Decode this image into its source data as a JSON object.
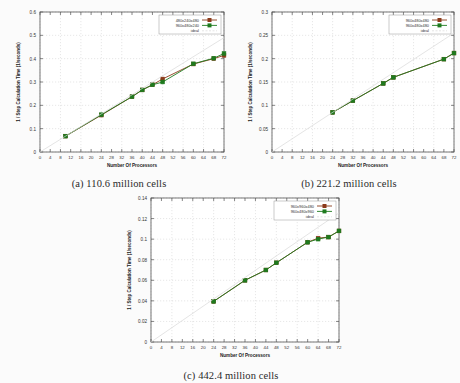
{
  "figure": {
    "background_color": "#fbfbfb",
    "panels": [
      {
        "key": "a",
        "caption": "(a) 110.6 million cells",
        "chart_data": {
          "type": "line",
          "title": "",
          "xlabel": "Number Of Processors",
          "ylabel": "1 / Step Calculation Time (1/seconds)",
          "xlim": [
            0,
            72
          ],
          "ylim": [
            0,
            0.6
          ],
          "xticks": [
            0,
            4,
            8,
            12,
            16,
            20,
            24,
            28,
            32,
            36,
            40,
            44,
            48,
            52,
            56,
            60,
            64,
            68,
            72
          ],
          "yticks": [
            0,
            0.1,
            0.2,
            0.3,
            0.4,
            0.5,
            0.6
          ],
          "xtick_labels": [
            "0",
            "4",
            "8",
            "12",
            "16",
            "20",
            "24",
            "28",
            "32",
            "36",
            "40",
            "44",
            "48",
            "52",
            "56",
            "60",
            "64",
            "68",
            "72"
          ],
          "ytick_labels": [
            "0",
            "0.1",
            "0.2",
            "0.3",
            "0.4",
            "0.5",
            "0.6"
          ],
          "grid": true,
          "legend_position": "top-right",
          "series": [
            {
              "name": "480x240x480",
              "color": "#8B3A1A",
              "marker": "square",
              "x": [
                10,
                24,
                36,
                40,
                44,
                48,
                60,
                68,
                72
              ],
              "y": [
                0.068,
                0.158,
                0.237,
                0.266,
                0.288,
                0.313,
                0.377,
                0.4,
                0.414
              ]
            },
            {
              "name": "960x480x240",
              "color": "#1E7A1E",
              "marker": "square",
              "x": [
                10,
                24,
                36,
                40,
                44,
                48,
                60,
                68,
                72
              ],
              "y": [
                0.068,
                0.16,
                0.237,
                0.266,
                0.288,
                0.3,
                0.378,
                0.402,
                0.422
              ]
            },
            {
              "name": "ideal",
              "color": "#d8d8d8",
              "marker": "none",
              "x": [
                0,
                72
              ],
              "y": [
                0,
                0.49
              ]
            }
          ]
        }
      },
      {
        "key": "b",
        "caption": "(b) 221.2 million cells",
        "chart_data": {
          "type": "line",
          "title": "",
          "xlabel": "Number Of Processors",
          "ylabel": "1 / Step Calculation Time (1/seconds)",
          "xlim": [
            0,
            72
          ],
          "ylim": [
            0,
            0.3
          ],
          "xticks": [
            0,
            4,
            8,
            12,
            16,
            20,
            24,
            28,
            32,
            36,
            40,
            44,
            48,
            52,
            56,
            60,
            64,
            68,
            72
          ],
          "yticks": [
            0,
            0.05,
            0.1,
            0.15,
            0.2,
            0.25,
            0.3
          ],
          "xtick_labels": [
            "0",
            "4",
            "8",
            "12",
            "16",
            "20",
            "24",
            "28",
            "32",
            "36",
            "40",
            "44",
            "48",
            "52",
            "56",
            "60",
            "64",
            "68",
            "72"
          ],
          "ytick_labels": [
            "0",
            "0.05",
            "0.1",
            "0.15",
            "0.2",
            "0.25",
            "0.3"
          ],
          "grid": true,
          "legend_position": "top-right",
          "series": [
            {
              "name": "960x480x480",
              "color": "#8B3A1A",
              "marker": "square",
              "x": [
                24,
                32,
                44,
                48,
                68,
                72
              ],
              "y": [
                0.085,
                0.11,
                0.147,
                0.16,
                0.199,
                0.212
              ]
            },
            {
              "name": "960x480x480",
              "color": "#1E7A1E",
              "marker": "square",
              "x": [
                24,
                32,
                44,
                48,
                68,
                72
              ],
              "y": [
                0.085,
                0.11,
                0.147,
                0.16,
                0.199,
                0.212
              ]
            },
            {
              "name": "ideal",
              "color": "#d8d8d8",
              "marker": "none",
              "x": [
                0,
                72
              ],
              "y": [
                0,
                0.255
              ]
            }
          ]
        }
      },
      {
        "key": "c",
        "caption": "(c) 442.4 million cells",
        "chart_data": {
          "type": "line",
          "title": "",
          "xlabel": "Number Of Processors",
          "ylabel": "1 / Step Calculation Time (1/seconds)",
          "xlim": [
            0,
            72
          ],
          "ylim": [
            0,
            0.14
          ],
          "xticks": [
            0,
            4,
            8,
            12,
            16,
            20,
            24,
            28,
            32,
            36,
            40,
            44,
            48,
            52,
            56,
            60,
            64,
            68,
            72
          ],
          "yticks": [
            0,
            0.02,
            0.04,
            0.06,
            0.08,
            0.1,
            0.12,
            0.14
          ],
          "xtick_labels": [
            "0",
            "4",
            "8",
            "12",
            "16",
            "20",
            "24",
            "28",
            "32",
            "36",
            "40",
            "44",
            "48",
            "52",
            "56",
            "60",
            "64",
            "68",
            "72"
          ],
          "ytick_labels": [
            "0",
            "0.02",
            "0.04",
            "0.06",
            "0.08",
            "0.1",
            "0.12",
            "0.14"
          ],
          "grid": true,
          "legend_position": "top-right",
          "series": [
            {
              "name": "960x960x480",
              "color": "#8B3A1A",
              "marker": "square",
              "x": [
                24,
                36,
                44,
                48,
                60,
                64,
                68,
                72
              ],
              "y": [
                0.0395,
                0.06,
                0.07,
                0.077,
                0.097,
                0.101,
                0.102,
                0.108
              ]
            },
            {
              "name": "960x480x960",
              "color": "#1E7A1E",
              "marker": "square",
              "x": [
                24,
                36,
                44,
                48,
                60,
                64,
                68,
                72
              ],
              "y": [
                0.0395,
                0.06,
                0.07,
                0.077,
                0.097,
                0.1,
                0.102,
                0.108
              ]
            },
            {
              "name": "ideal",
              "color": "#d8d8d8",
              "marker": "none",
              "x": [
                0,
                72
              ],
              "y": [
                0,
                0.1255
              ]
            }
          ]
        }
      }
    ]
  }
}
